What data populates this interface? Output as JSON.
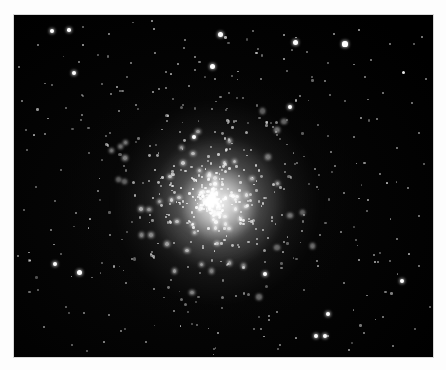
{
  "image": {
    "kind": "astronomical-photograph",
    "subject": "globular-star-cluster",
    "title": "",
    "caption": "",
    "orientation": "landscape",
    "canvas": {
      "width": 446,
      "height": 370
    },
    "plate": {
      "left": 14,
      "top": 15,
      "width": 419,
      "height": 342
    },
    "colors": {
      "page_background": "#fdfdfd",
      "plate_background": "#000000",
      "star_color": "#ffffff",
      "plate_border": "#d8d8d8"
    }
  },
  "chart_data": {
    "type": "scatter",
    "title": "",
    "xlabel": "",
    "ylabel": "",
    "grid": false,
    "legend": "none",
    "xlim": [
      0,
      419
    ],
    "ylim": [
      0,
      342
    ],
    "cluster": {
      "center": [
        198,
        185
      ],
      "core_radius": 40,
      "halo_radius": 105,
      "core_peak_brightness": 1.0
    },
    "series": [
      {
        "name": "field-stars",
        "points": [
          [
            38,
            16,
            4.0,
            1
          ],
          [
            55,
            15,
            3.5,
            1
          ],
          [
            24,
            30,
            1.6,
            0.5
          ],
          [
            95,
            19,
            1.8,
            0.6
          ],
          [
            140,
            14,
            2.0,
            0.7
          ],
          [
            206,
            19,
            5.0,
            1
          ],
          [
            171,
            25,
            1.4,
            0.5
          ],
          [
            270,
            20,
            1.6,
            0.6
          ],
          [
            281,
            27,
            5.0,
            1
          ],
          [
            345,
            15,
            2.2,
            0.7
          ],
          [
            376,
            29,
            1.5,
            0.5
          ],
          [
            408,
            22,
            2.0,
            0.6
          ],
          [
            331,
            29,
            5.2,
            1
          ],
          [
            270,
            44,
            2.0,
            0.7
          ],
          [
            198,
            51,
            5.0,
            1
          ],
          [
            357,
            45,
            1.5,
            0.5
          ],
          [
            400,
            29,
            1.4,
            0.4
          ],
          [
            69,
            30,
            2.0,
            0.7
          ],
          [
            5,
            52,
            1.6,
            0.5
          ],
          [
            60,
            58,
            4.0,
            1
          ],
          [
            117,
            48,
            1.6,
            0.5
          ],
          [
            181,
            55,
            1.6,
            0.5
          ],
          [
            389,
            57,
            3.0,
            0.9
          ],
          [
            351,
            62,
            1.4,
            0.5
          ],
          [
            113,
            62,
            1.4,
            0.4
          ],
          [
            152,
            57,
            1.6,
            0.5
          ],
          [
            38,
            70,
            1.4,
            0.4
          ],
          [
            88,
            69,
            1.4,
            0.4
          ],
          [
            247,
            64,
            1.5,
            0.5
          ],
          [
            311,
            66,
            1.6,
            0.5
          ],
          [
            412,
            64,
            1.5,
            0.5
          ],
          [
            97,
            79,
            1.5,
            0.5
          ],
          [
            215,
            78,
            1.4,
            0.4
          ],
          [
            286,
            81,
            1.5,
            0.5
          ],
          [
            369,
            78,
            1.5,
            0.5
          ],
          [
            8,
            86,
            1.5,
            0.5
          ],
          [
            52,
            93,
            1.4,
            0.4
          ],
          [
            122,
            90,
            1.5,
            0.5
          ],
          [
            276,
            92,
            4.2,
            1
          ],
          [
            331,
            86,
            1.5,
            0.4
          ],
          [
            398,
            88,
            1.5,
            0.5
          ],
          [
            67,
            105,
            1.4,
            0.4
          ],
          [
            154,
            101,
            1.5,
            0.5
          ],
          [
            222,
            106,
            1.5,
            0.5
          ],
          [
            304,
            110,
            1.4,
            0.4
          ],
          [
            363,
            104,
            1.6,
            0.5
          ],
          [
            31,
            119,
            1.5,
            0.5
          ],
          [
            96,
            118,
            1.5,
            0.4
          ],
          [
            180,
            122,
            4.5,
            1
          ],
          [
            262,
            117,
            1.4,
            0.4
          ],
          [
            340,
            122,
            1.5,
            0.5
          ],
          [
            405,
            118,
            1.5,
            0.5
          ],
          [
            13,
            135,
            1.4,
            0.4
          ],
          [
            75,
            138,
            1.5,
            0.4
          ],
          [
            136,
            131,
            1.5,
            0.5
          ],
          [
            230,
            135,
            1.4,
            0.4
          ],
          [
            317,
            137,
            1.5,
            0.5
          ],
          [
            383,
            133,
            1.5,
            0.5
          ],
          [
            47,
            155,
            1.4,
            0.4
          ],
          [
            110,
            151,
            1.4,
            0.4
          ],
          [
            301,
            154,
            1.6,
            0.5
          ],
          [
            366,
            159,
            1.5,
            0.5
          ],
          [
            410,
            149,
            1.4,
            0.4
          ],
          [
            22,
            172,
            1.4,
            0.4
          ],
          [
            84,
            176,
            1.5,
            0.5
          ],
          [
            330,
            178,
            1.5,
            0.5
          ],
          [
            394,
            173,
            1.5,
            0.5
          ],
          [
            10,
            195,
            1.4,
            0.4
          ],
          [
            62,
            198,
            1.5,
            0.5
          ],
          [
            353,
            196,
            1.4,
            0.4
          ],
          [
            405,
            201,
            1.5,
            0.5
          ],
          [
            37,
            215,
            1.5,
            0.5
          ],
          [
            96,
            220,
            1.5,
            0.5
          ],
          [
            327,
            217,
            1.5,
            0.5
          ],
          [
            383,
            224,
            1.5,
            0.5
          ],
          [
            41,
            249,
            4.5,
            1
          ],
          [
            65,
            257,
            5.0,
            1
          ],
          [
            4,
            241,
            1.6,
            0.5
          ],
          [
            118,
            244,
            1.5,
            0.5
          ],
          [
            174,
            252,
            1.6,
            0.5
          ],
          [
            213,
            250,
            1.4,
            0.4
          ],
          [
            251,
            259,
            4.0,
            1
          ],
          [
            303,
            246,
            1.5,
            0.5
          ],
          [
            360,
            240,
            1.5,
            0.5
          ],
          [
            405,
            251,
            1.5,
            0.5
          ],
          [
            112,
            268,
            1.5,
            0.5
          ],
          [
            24,
            275,
            1.4,
            0.4
          ],
          [
            140,
            274,
            1.5,
            0.5
          ],
          [
            222,
            281,
            1.5,
            0.5
          ],
          [
            290,
            275,
            1.4,
            0.4
          ],
          [
            330,
            268,
            1.5,
            0.5
          ],
          [
            388,
            266,
            4.5,
            1
          ],
          [
            52,
            292,
            1.4,
            0.4
          ],
          [
            95,
            300,
            1.5,
            0.5
          ],
          [
            160,
            296,
            1.5,
            0.5
          ],
          [
            208,
            293,
            1.4,
            0.4
          ],
          [
            263,
            297,
            1.5,
            0.5
          ],
          [
            314,
            299,
            4.2,
            1
          ],
          [
            369,
            302,
            1.5,
            0.5
          ],
          [
            416,
            292,
            1.4,
            0.4
          ],
          [
            30,
            312,
            1.5,
            0.5
          ],
          [
            107,
            316,
            1.5,
            0.5
          ],
          [
            183,
            310,
            1.4,
            0.4
          ],
          [
            247,
            314,
            1.5,
            0.5
          ],
          [
            302,
            321,
            4.5,
            1
          ],
          [
            311,
            321,
            4.8,
            1
          ],
          [
            350,
            318,
            1.5,
            0.5
          ],
          [
            401,
            314,
            1.4,
            0.4
          ],
          [
            58,
            330,
            1.4,
            0.4
          ],
          [
            132,
            327,
            1.5,
            0.5
          ],
          [
            200,
            334,
            1.4,
            0.4
          ],
          [
            266,
            330,
            1.5,
            0.5
          ],
          [
            379,
            331,
            1.5,
            0.5
          ],
          [
            69,
            12,
            1.4,
            0.4
          ],
          [
            12,
            115,
            1.4,
            0.4
          ],
          [
            244,
            34,
            1.4,
            0.4
          ],
          [
            314,
            48,
            1.3,
            0.4
          ],
          [
            169,
            90,
            1.4,
            0.4
          ],
          [
            41,
            186,
            1.3,
            0.4
          ]
        ]
      },
      {
        "name": "cluster-member-stars",
        "count": 520,
        "distribution": "king-profile-radial",
        "center": [
          198,
          185
        ],
        "core_radius": 40,
        "tidal_radius": 112
      }
    ]
  },
  "a11y": {
    "alt_text": "Black-and-white astronomical photograph of a dense globular star cluster centered in a star field on a black plate with a white paper margin."
  }
}
